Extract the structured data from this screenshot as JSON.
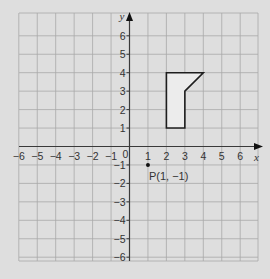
{
  "colors": {
    "background": "#dedede",
    "grid": "#a8a8a8",
    "axis": "#3a3a3a",
    "shape_stroke": "#1e1e1e",
    "shape_fill": "#ececec",
    "text": "#333333"
  },
  "grid": {
    "xmin": -6,
    "xmax": 6.5,
    "ymin": -6.5,
    "ymax": 6.5,
    "origin_px": [
      129.5,
      146.5
    ],
    "unit_px": 18.45,
    "left_px": 19,
    "right_px": 258,
    "top_px": 13,
    "bottom_px": 261
  },
  "axes": {
    "x_label": "x",
    "y_label": "y",
    "origin_label": "0",
    "x_ticks": [
      "-6",
      "-5",
      "-4",
      "-3",
      "-2",
      "-1",
      "1",
      "2",
      "3",
      "4",
      "5",
      "6"
    ],
    "y_ticks": [
      "6",
      "5",
      "4",
      "3",
      "2",
      "1",
      "-1",
      "-2",
      "-3",
      "-4",
      "-5",
      "-6"
    ]
  },
  "shape": {
    "vertices": [
      [
        2,
        1
      ],
      [
        2,
        4
      ],
      [
        4,
        4
      ],
      [
        3,
        3
      ],
      [
        3,
        1
      ]
    ]
  },
  "point": {
    "name": "P",
    "coords": [
      1,
      -1
    ],
    "label": "P(1, -1)"
  }
}
